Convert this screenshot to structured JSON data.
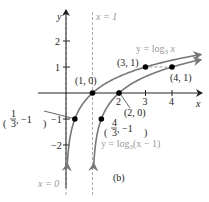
{
  "chart_data": {
    "type": "line",
    "title": "",
    "panel_label": "(b)",
    "xlabel": "x",
    "ylabel": "y",
    "xlim": [
      -2.4,
      5.2
    ],
    "ylim": [
      -3.2,
      3.5
    ],
    "grid": false,
    "x_ticks": [
      2,
      3,
      4
    ],
    "x_tick_labels": [
      "2",
      "3",
      "4"
    ],
    "y_ticks": [
      2,
      1,
      -1,
      -2
    ],
    "y_tick_labels": [
      "2",
      "1",
      "−1",
      "−2"
    ],
    "asymptotes": [
      {
        "x": 0,
        "label": "x = 0"
      },
      {
        "x": 1,
        "label": "x = 1"
      }
    ],
    "series": [
      {
        "name": "y = log₃ x",
        "label_main": "y = log",
        "label_sub": "3",
        "label_tail": " x",
        "function": "log3(x)",
        "domain_start": 0,
        "color": "#888888",
        "points": [
          {
            "x": 0.3333,
            "y": -1,
            "label": "(1/3, −1)"
          },
          {
            "x": 1,
            "y": 0,
            "label": "(1, 0)"
          },
          {
            "x": 3,
            "y": 1,
            "label": "(3, 1)"
          }
        ]
      },
      {
        "name": "y = log₃(x − 1)",
        "label_main": "y = log",
        "label_sub": "3",
        "label_tail": "(x − 1)",
        "function": "log3(x-1)",
        "domain_start": 1,
        "color": "#888888",
        "points": [
          {
            "x": 1.3333,
            "y": -1,
            "label": "(4/3, −1)"
          },
          {
            "x": 2,
            "y": 0,
            "label": "(2, 0)"
          },
          {
            "x": 4,
            "y": 1,
            "label": "(4, 1)"
          }
        ]
      }
    ],
    "point_labels": {
      "p_1_0": "(1, 0)",
      "p_3_1": "(3, 1)",
      "p_4_1": "(4, 1)",
      "p_2_0": "(2, 0)",
      "p_third_num": "1",
      "p_third_den": "3",
      "p_third_y": ", −1",
      "p_43_num": "4",
      "p_43_den": "3",
      "p_43_y": ", −1"
    }
  }
}
